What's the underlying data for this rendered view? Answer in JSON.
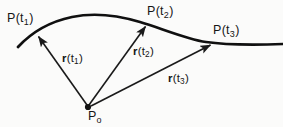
{
  "figure": {
    "background_color": "#fbfbfa",
    "ink_color": "#161616",
    "curve_color": "#101010",
    "vector_color": "#1a1a1a"
  },
  "points": [
    {
      "id": "p-t1",
      "label_P": "P",
      "label_open": "(",
      "label_t": "t",
      "label_sub": "1",
      "label_close": ")",
      "full_label": "P(t1)",
      "x": 35,
      "y": 33
    },
    {
      "id": "p-t2",
      "label_P": "P",
      "label_open": "(",
      "label_t": "t",
      "label_sub": "2",
      "label_close": ")",
      "full_label": "P(t2)",
      "x": 148,
      "y": 23
    },
    {
      "id": "p-t3",
      "label_P": "P",
      "label_open": "(",
      "label_t": "t",
      "label_sub": "3",
      "label_close": ")",
      "full_label": "P(t3)",
      "x": 214,
      "y": 43
    }
  ],
  "origin": {
    "id": "p-origin",
    "label_P": "P",
    "label_sub": "o",
    "full_label": "Po",
    "x": 88,
    "y": 107
  },
  "vectors": [
    {
      "id": "r-t1",
      "label_r": "r",
      "label_open": "(",
      "label_t": "t",
      "label_sub": "1",
      "label_close": ")",
      "full_label": "r(t1)",
      "from_x": 88,
      "from_y": 107,
      "to_x": 35,
      "to_y": 33
    },
    {
      "id": "r-t2",
      "label_r": "r",
      "label_open": "(",
      "label_t": "t",
      "label_sub": "2",
      "label_close": ")",
      "full_label": "r(t2)",
      "from_x": 88,
      "from_y": 107,
      "to_x": 148,
      "to_y": 23
    },
    {
      "id": "r-t3",
      "label_r": "r",
      "label_open": "(",
      "label_t": "t",
      "label_sub": "3",
      "label_close": ")",
      "full_label": "r(t3)",
      "from_x": 88,
      "from_y": 107,
      "to_x": 214,
      "to_y": 43
    }
  ],
  "curve": {
    "id": "space-curve",
    "description": "smooth S-shaped curve rising from lower-left, cresting, descending, then leveling at right"
  }
}
